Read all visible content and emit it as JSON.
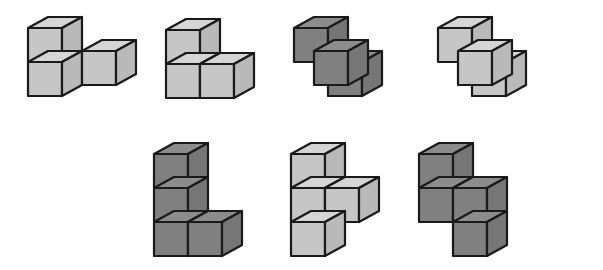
{
  "page": {
    "background_color": "#ffffff",
    "width": 603,
    "height": 270,
    "figure_count": 7
  },
  "palette": {
    "light_top": "#d5d5d5",
    "light_left": "#c6c6c6",
    "light_right": "#b9b9b9",
    "dark_top": "#8c8c8c",
    "dark_left": "#808080",
    "dark_right": "#767676",
    "outline": "#1a1a1a"
  },
  "geometry": {
    "cube_width": 34,
    "cube_height": 34,
    "iso_dx": 20,
    "iso_dy": 11
  },
  "figures": [
    {
      "id": "figure-1",
      "label": "Figure 1",
      "shade": "light",
      "origin_x": 22,
      "origin_y": 22,
      "cube_count": 3,
      "description": "tri-cube step: upper-back cube, lower-back cube, front-right cube",
      "cubes": [
        {
          "x": 0,
          "y": 0,
          "z": 1
        },
        {
          "x": 0,
          "y": 0,
          "z": 0
        },
        {
          "x": 1,
          "y": 1,
          "z": 0
        }
      ]
    },
    {
      "id": "figure-2",
      "label": "Figure 2",
      "shade": "light",
      "origin_x": 160,
      "origin_y": 24,
      "cube_count": 3,
      "description": "two cubes side by side with one cube stacked on the left-back one",
      "cubes": [
        {
          "x": 0,
          "y": 0,
          "z": 0
        },
        {
          "x": 1,
          "y": 0,
          "z": 0
        },
        {
          "x": 0,
          "y": 0,
          "z": 1
        }
      ]
    },
    {
      "id": "figure-3",
      "label": "Figure 3",
      "shade": "dark",
      "origin_x": 288,
      "origin_y": 22,
      "cube_count": 3,
      "description": "tri-cube corner: raised back cube, front-left cube, right cube",
      "cubes": [
        {
          "x": 0,
          "y": 0,
          "z": 1
        },
        {
          "x": 0,
          "y": 1,
          "z": 0
        },
        {
          "x": 1,
          "y": 0,
          "z": 0
        }
      ]
    },
    {
      "id": "figure-4",
      "label": "Figure 4",
      "shade": "light",
      "origin_x": 432,
      "origin_y": 22,
      "cube_count": 3,
      "description": "tri-cube corner mirrored: raised back cube, front-left cube, right cube",
      "cubes": [
        {
          "x": 0,
          "y": 0,
          "z": 1
        },
        {
          "x": 0,
          "y": 1,
          "z": 0
        },
        {
          "x": 1,
          "y": 0,
          "z": 0
        }
      ]
    },
    {
      "id": "figure-5",
      "label": "Figure 5",
      "shade": "dark",
      "origin_x": 148,
      "origin_y": 148,
      "cube_count": 4,
      "description": "L shape: vertical column of three with one cube to the right at the bottom",
      "cubes": [
        {
          "x": 0,
          "y": 0,
          "z": 0
        },
        {
          "x": 0,
          "y": 0,
          "z": 1
        },
        {
          "x": 0,
          "y": 0,
          "z": 2
        },
        {
          "x": 1,
          "y": 0,
          "z": 0
        }
      ]
    },
    {
      "id": "figure-6",
      "label": "Figure 6",
      "shade": "light",
      "origin_x": 285,
      "origin_y": 148,
      "cube_count": 4,
      "description": "T shape: vertical column of three with one cube right of the middle",
      "cubes": [
        {
          "x": 0,
          "y": 0,
          "z": 0
        },
        {
          "x": 0,
          "y": 0,
          "z": 1
        },
        {
          "x": 0,
          "y": 0,
          "z": 2
        },
        {
          "x": 1,
          "y": 0,
          "z": 1
        }
      ]
    },
    {
      "id": "figure-7",
      "label": "Figure 7",
      "shade": "dark",
      "origin_x": 413,
      "origin_y": 148,
      "cube_count": 4,
      "description": "S shape: two stacked cubes left, two stacked cubes right offset one lower",
      "cubes": [
        {
          "x": 0,
          "y": 0,
          "z": 1
        },
        {
          "x": 0,
          "y": 0,
          "z": 2
        },
        {
          "x": 1,
          "y": 0,
          "z": 0
        },
        {
          "x": 1,
          "y": 0,
          "z": 1
        }
      ]
    }
  ]
}
